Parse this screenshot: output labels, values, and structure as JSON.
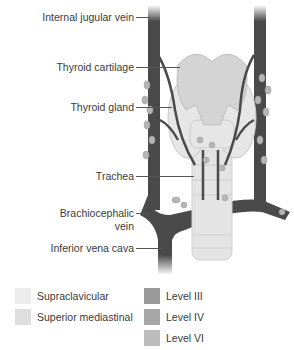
{
  "labels": [
    {
      "id": "internal-jugular-vein",
      "text": "Internal jugular vein",
      "y": 17
    },
    {
      "id": "thyroid-cartilage",
      "text": "Thyroid cartilage",
      "y": 67
    },
    {
      "id": "thyroid-gland",
      "text": "Thyroid gland",
      "y": 107
    },
    {
      "id": "trachea",
      "text": "Trachea",
      "y": 176
    },
    {
      "id": "brachiocephalic-vein",
      "text": "Brachiocephalic",
      "text2": "vein",
      "y": 213
    },
    {
      "id": "inferior-vena-cava",
      "text": "Inferior vena cava",
      "y": 248
    }
  ],
  "legend": {
    "left": [
      {
        "label": "Supraclavicular",
        "color": "#ececec"
      },
      {
        "label": "Superior mediastinal",
        "color": "#dedede"
      }
    ],
    "right": [
      {
        "label": "Level III",
        "color": "#9a9a9a"
      },
      {
        "label": "Level IV",
        "color": "#a6a6a6"
      },
      {
        "label": "Level VI",
        "color": "#bcbcbc"
      }
    ]
  },
  "colors": {
    "vein": "#4a4a4a",
    "thyroid": "#dcdcdc",
    "cartilage": "#cfcfcf",
    "trachea": "#e2e2e2",
    "node": "#b3b3b3"
  }
}
